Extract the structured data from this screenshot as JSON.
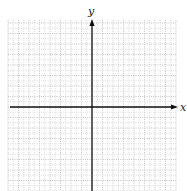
{
  "diagram": {
    "type": "coordinate-plane",
    "x_axis_label": "x",
    "y_axis_label": "y",
    "grid": {
      "left": 8,
      "top": 20,
      "right": 176,
      "bottom": 191,
      "origin_x": 92,
      "origin_y": 107,
      "major_step": 10.5,
      "minor_divisions": 2,
      "major_color": "#b8b8b8",
      "minor_color": "#d4d4d4"
    },
    "axis_color": "#111111"
  }
}
